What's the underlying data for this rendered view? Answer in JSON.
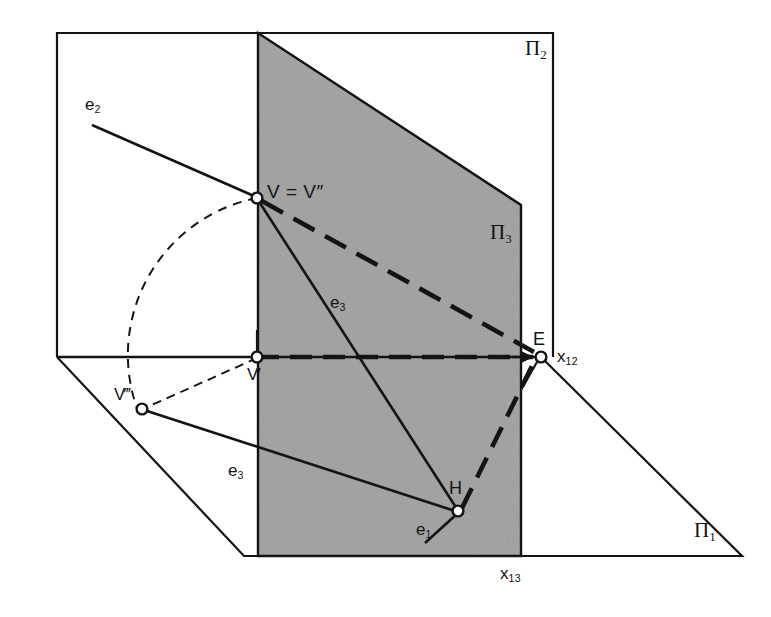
{
  "figure": {
    "kind": "descriptive-geometry-projection-diagram",
    "background_color": "#ffffff",
    "line_color": "#141414",
    "plane_fill_color": "#9a9a9a"
  },
  "planes": [
    {
      "id": "pi1",
      "label": "Π",
      "subscript": "1",
      "name": "horizontal-projection-plane"
    },
    {
      "id": "pi2",
      "label": "Π",
      "subscript": "2",
      "name": "vertical-projection-plane"
    },
    {
      "id": "pi3",
      "label": "Π",
      "subscript": "3",
      "name": "auxiliary-profile-plane"
    }
  ],
  "points": [
    {
      "id": "V",
      "label": "V = V″",
      "name": "point-v-and-v-double-prime"
    },
    {
      "id": "Vp",
      "label": "V′",
      "name": "point-v-prime"
    },
    {
      "id": "Vppp",
      "label": "V‴",
      "name": "point-v-triple-prime"
    },
    {
      "id": "E",
      "label": "E",
      "name": "point-e"
    },
    {
      "id": "H",
      "label": "H",
      "name": "point-h"
    }
  ],
  "lines": [
    {
      "id": "e1",
      "label": "e",
      "subscript": "1",
      "name": "line-e1"
    },
    {
      "id": "e2",
      "label": "e",
      "subscript": "2",
      "name": "line-e2"
    },
    {
      "id": "e3a",
      "label": "e",
      "subscript": "3",
      "name": "line-e3-in-plane"
    },
    {
      "id": "e3b",
      "label": "e",
      "subscript": "3",
      "name": "line-e3-rotated"
    }
  ],
  "axes": [
    {
      "id": "x12",
      "label": "x",
      "subscript": "12",
      "name": "ground-line-x12"
    },
    {
      "id": "x13",
      "label": "x",
      "subscript": "13",
      "name": "ground-line-x13"
    }
  ],
  "labels": {
    "pi1": {
      "base": "Π",
      "sub": "1"
    },
    "pi2": {
      "base": "Π",
      "sub": "2"
    },
    "pi3": {
      "base": "Π",
      "sub": "3"
    },
    "v_equals_vpp": "V = V″",
    "v_prime": "V′",
    "v_triple_prime": "V‴",
    "point_e": "E",
    "point_h": "H",
    "e1": {
      "base": "e",
      "sub": "1"
    },
    "e2": {
      "base": "e",
      "sub": "2"
    },
    "e3_in_plane": {
      "base": "e",
      "sub": "3"
    },
    "e3_rotated": {
      "base": "e",
      "sub": "3"
    },
    "x12": {
      "base": "x",
      "sub": "12"
    },
    "x13": {
      "base": "x",
      "sub": "13"
    }
  }
}
